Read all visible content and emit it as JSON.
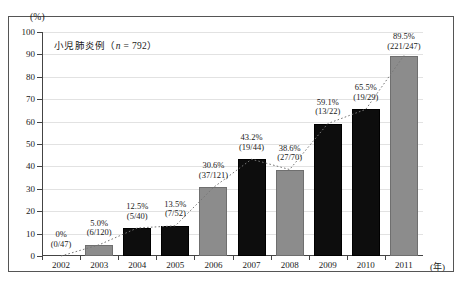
{
  "figure": {
    "unit_label": "(%)",
    "x_unit_label": "(年)",
    "title": "小児肺炎例（n = 792）",
    "title_prefix": "小児肺炎例（",
    "title_italic": "n",
    "title_suffix": " = 792）"
  },
  "colors": {
    "gray_bar": "#8c8c8c",
    "black_bar": "#0d0d0d",
    "axis": "#444444",
    "grid": "#e2e2e2",
    "frame": "#555555",
    "text": "#1a1a1a"
  },
  "chart_data": {
    "type": "bar",
    "title": "小児肺炎例（n = 792）",
    "xlabel": "(年)",
    "ylabel": "(%)",
    "ylim": [
      0,
      100
    ],
    "ytick_labels": [
      "0",
      "10",
      "20",
      "30",
      "40",
      "50",
      "60",
      "70",
      "80",
      "90",
      "100"
    ],
    "ytick_values": [
      0,
      10,
      20,
      30,
      40,
      50,
      60,
      70,
      80,
      90,
      100
    ],
    "grid": true,
    "legend": "none",
    "categories": [
      "2002",
      "2003",
      "2004",
      "2005",
      "2006",
      "2007",
      "2008",
      "2009",
      "2010",
      "2011"
    ],
    "values": [
      0,
      5.0,
      12.5,
      13.5,
      30.6,
      43.2,
      38.6,
      59.1,
      65.5,
      89.5
    ],
    "bar_colors": [
      "none",
      "gray",
      "black",
      "black",
      "gray",
      "black",
      "gray",
      "black",
      "black",
      "gray"
    ],
    "point_labels": [
      {
        "year": "2002",
        "percent": "0%",
        "fraction": "(0/47)",
        "value": 0,
        "numerator": 0,
        "denominator": 47
      },
      {
        "year": "2003",
        "percent": "5.0%",
        "fraction": "(6/120)",
        "value": 5.0,
        "numerator": 6,
        "denominator": 120
      },
      {
        "year": "2004",
        "percent": "12.5%",
        "fraction": "(5/40)",
        "value": 12.5,
        "numerator": 5,
        "denominator": 40
      },
      {
        "year": "2005",
        "percent": "13.5%",
        "fraction": "(7/52)",
        "value": 13.5,
        "numerator": 7,
        "denominator": 52
      },
      {
        "year": "2006",
        "percent": "30.6%",
        "fraction": "(37/121)",
        "value": 30.6,
        "numerator": 37,
        "denominator": 121
      },
      {
        "year": "2007",
        "percent": "43.2%",
        "fraction": "(19/44)",
        "value": 43.2,
        "numerator": 19,
        "denominator": 44
      },
      {
        "year": "2008",
        "percent": "38.6%",
        "fraction": "(27/70)",
        "value": 38.6,
        "numerator": 27,
        "denominator": 70
      },
      {
        "year": "2009",
        "percent": "59.1%",
        "fraction": "(13/22)",
        "value": 59.1,
        "numerator": 13,
        "denominator": 22
      },
      {
        "year": "2010",
        "percent": "65.5%",
        "fraction": "(19/29)",
        "value": 65.5,
        "numerator": 19,
        "denominator": 29
      },
      {
        "year": "2011",
        "percent": "89.5%",
        "fraction": "(221/247)",
        "value": 89.5,
        "numerator": 221,
        "denominator": 247
      }
    ],
    "trend_line": {
      "style": "dotted",
      "color": "#777777"
    }
  }
}
